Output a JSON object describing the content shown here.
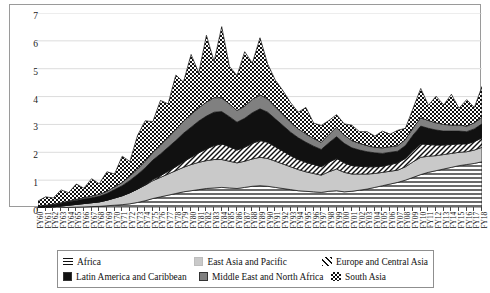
{
  "chart_data": {
    "type": "area",
    "stacked": true,
    "title": "",
    "subtitle": "",
    "xlabel": "",
    "ylabel": "",
    "ylim": [
      0,
      7
    ],
    "yticks": [
      0,
      1,
      2,
      3,
      4,
      5,
      6,
      7
    ],
    "grid": true,
    "legend_position": "bottom",
    "categories": [
      "FY60",
      "FY61",
      "FY62",
      "FY63",
      "FY64",
      "FY65",
      "FY66",
      "FY67",
      "FY68",
      "FY69",
      "FY70",
      "FY71",
      "FY72",
      "FY73",
      "FY74",
      "FY75",
      "FY76",
      "FY77",
      "FY78",
      "FY79",
      "FY80",
      "FY81",
      "FY82",
      "FY83",
      "FY84",
      "FY85",
      "FY86",
      "FY87",
      "FY88",
      "FY89",
      "FY90",
      "FY91",
      "FY92",
      "FY93",
      "FY94",
      "FY95",
      "FY96",
      "FY97",
      "FY98",
      "FY99",
      "FY00",
      "FY01",
      "FY02",
      "FY03",
      "FY04",
      "FY05",
      "FY06",
      "FY07",
      "FY08",
      "FY09",
      "FY10",
      "FY11",
      "FY12",
      "FY13",
      "FY14",
      "FY15",
      "FY16",
      "FY17",
      "FY18"
    ],
    "series": [
      {
        "name": "Africa",
        "pattern": "horizontal-lines",
        "color": "#ffffff",
        "values": [
          0.0,
          0.0,
          0.0,
          0.01,
          0.02,
          0.03,
          0.04,
          0.05,
          0.06,
          0.08,
          0.1,
          0.12,
          0.15,
          0.2,
          0.26,
          0.34,
          0.4,
          0.46,
          0.52,
          0.58,
          0.62,
          0.66,
          0.7,
          0.72,
          0.74,
          0.72,
          0.7,
          0.74,
          0.78,
          0.8,
          0.78,
          0.74,
          0.7,
          0.66,
          0.62,
          0.6,
          0.58,
          0.56,
          0.6,
          0.62,
          0.58,
          0.6,
          0.64,
          0.68,
          0.74,
          0.8,
          0.86,
          0.92,
          1.0,
          1.1,
          1.2,
          1.28,
          1.34,
          1.4,
          1.46,
          1.52,
          1.56,
          1.6,
          1.66
        ]
      },
      {
        "name": "East Asia and Pacific",
        "pattern": "light-gray",
        "color": "#c9c9c9",
        "values": [
          0.02,
          0.03,
          0.04,
          0.06,
          0.08,
          0.1,
          0.12,
          0.14,
          0.16,
          0.2,
          0.26,
          0.32,
          0.4,
          0.48,
          0.56,
          0.64,
          0.7,
          0.76,
          0.82,
          0.88,
          0.94,
          0.98,
          1.0,
          1.02,
          1.0,
          0.96,
          0.92,
          0.94,
          0.98,
          1.02,
          1.0,
          0.94,
          0.88,
          0.82,
          0.76,
          0.7,
          0.66,
          0.62,
          0.7,
          0.78,
          0.7,
          0.62,
          0.58,
          0.54,
          0.5,
          0.48,
          0.46,
          0.44,
          0.48,
          0.56,
          0.62,
          0.58,
          0.54,
          0.52,
          0.5,
          0.48,
          0.46,
          0.48,
          0.52
        ]
      },
      {
        "name": "Europe and Central Asia",
        "pattern": "diagonal-lines",
        "color": "#ffffff",
        "values": [
          0.0,
          0.0,
          0.0,
          0.0,
          0.0,
          0.0,
          0.0,
          0.0,
          0.0,
          0.0,
          0.0,
          0.0,
          0.0,
          0.0,
          0.02,
          0.04,
          0.06,
          0.1,
          0.14,
          0.2,
          0.26,
          0.34,
          0.42,
          0.5,
          0.56,
          0.52,
          0.46,
          0.5,
          0.56,
          0.6,
          0.58,
          0.52,
          0.46,
          0.4,
          0.36,
          0.34,
          0.32,
          0.3,
          0.34,
          0.38,
          0.34,
          0.3,
          0.28,
          0.26,
          0.24,
          0.22,
          0.24,
          0.26,
          0.3,
          0.4,
          0.48,
          0.42,
          0.38,
          0.34,
          0.32,
          0.3,
          0.28,
          0.3,
          0.34
        ]
      },
      {
        "name": "Latin America and Caribbean",
        "pattern": "solid-black",
        "color": "#111111",
        "values": [
          0.04,
          0.06,
          0.08,
          0.1,
          0.12,
          0.14,
          0.16,
          0.18,
          0.2,
          0.24,
          0.3,
          0.36,
          0.44,
          0.52,
          0.6,
          0.7,
          0.78,
          0.86,
          0.94,
          1.02,
          1.08,
          1.14,
          1.18,
          1.2,
          1.16,
          1.08,
          1.0,
          1.04,
          1.1,
          1.14,
          1.08,
          1.0,
          0.92,
          0.84,
          0.78,
          0.72,
          0.66,
          0.62,
          0.7,
          0.78,
          0.7,
          0.64,
          0.58,
          0.54,
          0.5,
          0.46,
          0.44,
          0.42,
          0.46,
          0.56,
          0.64,
          0.58,
          0.54,
          0.5,
          0.48,
          0.46,
          0.44,
          0.46,
          0.5
        ]
      },
      {
        "name": "Middle East and North Africa",
        "pattern": "medium-gray",
        "color": "#808080",
        "values": [
          0.01,
          0.01,
          0.02,
          0.02,
          0.03,
          0.04,
          0.05,
          0.06,
          0.07,
          0.08,
          0.1,
          0.12,
          0.16,
          0.2,
          0.24,
          0.28,
          0.32,
          0.36,
          0.4,
          0.44,
          0.46,
          0.48,
          0.5,
          0.52,
          0.5,
          0.46,
          0.42,
          0.44,
          0.48,
          0.5,
          0.48,
          0.44,
          0.4,
          0.36,
          0.32,
          0.3,
          0.28,
          0.26,
          0.3,
          0.34,
          0.3,
          0.26,
          0.24,
          0.22,
          0.2,
          0.2,
          0.2,
          0.2,
          0.22,
          0.26,
          0.3,
          0.28,
          0.26,
          0.24,
          0.22,
          0.22,
          0.2,
          0.22,
          0.24
        ]
      },
      {
        "name": "South Asia",
        "pattern": "checkerboard",
        "color": "#ffffff",
        "values": [
          0.18,
          0.3,
          0.22,
          0.46,
          0.3,
          0.55,
          0.34,
          0.62,
          0.38,
          0.7,
          0.46,
          0.94,
          0.52,
          1.2,
          1.45,
          1.1,
          1.6,
          1.2,
          1.95,
          1.4,
          2.15,
          1.25,
          2.4,
          1.3,
          2.55,
          1.35,
          1.25,
          1.95,
          1.3,
          2.05,
          1.25,
          0.95,
          0.85,
          0.7,
          0.6,
          0.95,
          0.55,
          0.6,
          0.5,
          0.45,
          0.4,
          0.55,
          0.42,
          0.5,
          0.4,
          0.6,
          0.45,
          0.55,
          0.4,
          0.7,
          1.05,
          0.55,
          0.95,
          0.7,
          1.1,
          0.6,
          0.95,
          0.55,
          1.1
        ]
      }
    ]
  },
  "legend": {
    "rows": [
      [
        {
          "label": "Africa",
          "swatch": "horizontal-lines"
        },
        {
          "label": "East Asia and Pacific",
          "swatch": "light-gray"
        },
        {
          "label": "Europe and Central Asia",
          "swatch": "diagonal-lines"
        }
      ],
      [
        {
          "label": "Latin America and Caribbean",
          "swatch": "solid-black"
        },
        {
          "label": "Middle East and North Africa",
          "swatch": "medium-gray"
        },
        {
          "label": "South Asia",
          "swatch": "checkerboard"
        }
      ]
    ]
  }
}
